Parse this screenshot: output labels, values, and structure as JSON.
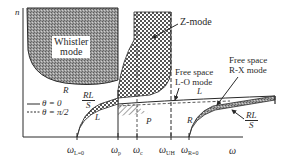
{
  "diagram": {
    "y_axis_label": "n",
    "x_axis_label": "ω",
    "x_axis_end_label": "S",
    "ticks": [
      {
        "symbol": "ω",
        "sub": "L=0",
        "x": 77
      },
      {
        "symbol": "ω",
        "sub": "p",
        "x": 118
      },
      {
        "symbol": "ω",
        "sub": "c",
        "x": 137
      },
      {
        "symbol": "ω",
        "sub": "UH",
        "x": 170
      },
      {
        "symbol": "ω",
        "sub": "R=0",
        "x": 189
      }
    ],
    "regions": {
      "whistler": {
        "line1": "Whistler",
        "line2": "mode",
        "branch_label": "R"
      },
      "z_mode": {
        "label": "Z-mode"
      },
      "free_space_lo": {
        "line1": "Free space",
        "line2": "L-O mode"
      },
      "free_space_rx": {
        "line1": "Free space",
        "line2": "R-X mode"
      }
    },
    "curve_labels": {
      "rl_over_s_left": {
        "num": "RL",
        "den": "S"
      },
      "rl_over_s_right": {
        "num": "RL",
        "den": "S"
      },
      "L_low": "L",
      "L_high": "L",
      "P": "P",
      "R_low": "R"
    },
    "legend": [
      {
        "style": "solid",
        "label": "θ = 0"
      },
      {
        "style": "dashed",
        "label": "θ = π/2"
      }
    ],
    "colors": {
      "line": "#2a2a2a",
      "whistler_fill": "#8a8a8a",
      "crosshatch": "#555555"
    }
  }
}
